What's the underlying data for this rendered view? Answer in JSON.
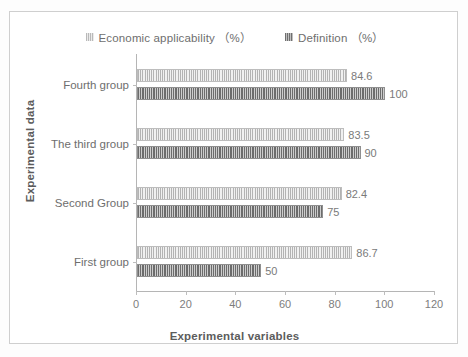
{
  "chart_data": {
    "type": "bar",
    "orientation": "horizontal",
    "title": "",
    "xlabel": "Experimental variables",
    "ylabel": "Experimental data",
    "categories": [
      "First group",
      "Second Group",
      "The third group",
      "Fourth group"
    ],
    "series": [
      {
        "name": "Economic applicability （%）",
        "values": [
          86.7,
          82.4,
          83.5,
          84.6
        ],
        "labels": [
          "86.7",
          "82.4",
          "83.5",
          "84.6"
        ],
        "color": "#dcdcdc",
        "pattern": "vertical-stripes-light"
      },
      {
        "name": "Definition （%）",
        "values": [
          50,
          75,
          90,
          100
        ],
        "labels": [
          "50",
          "75",
          "90",
          "100"
        ],
        "color": "#a8a8a8",
        "pattern": "vertical-stripes-dark"
      }
    ],
    "xlim": [
      0,
      120
    ],
    "xticks": [
      0,
      20,
      40,
      60,
      80,
      100,
      120
    ],
    "xtick_labels": [
      "0",
      "20",
      "40",
      "60",
      "80",
      "100",
      "120"
    ],
    "grid": false,
    "legend_position": "top-center",
    "frame": true
  },
  "legend": {
    "items": [
      {
        "label": "Economic applicability （%）",
        "swatch": "legend-swatch-economic-applicability"
      },
      {
        "label": "Definition （%）",
        "swatch": "legend-swatch-definition"
      }
    ]
  },
  "axes": {
    "x_title": "Experimental variables",
    "y_title": "Experimental data"
  }
}
